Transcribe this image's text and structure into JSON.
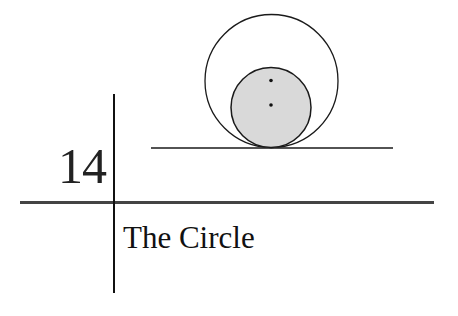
{
  "chapter": {
    "number": "14",
    "title": "The Circle"
  },
  "illustration": {
    "description": "Two circles tangent internally at a point on a horizontal line; the inner circle is shaded gray with two center points marked",
    "colors": {
      "stroke": "#1a1a1a",
      "inner_fill": "#d9d9d9",
      "rule_vertical": "#111111",
      "rule_horizontal": "#444444"
    }
  }
}
